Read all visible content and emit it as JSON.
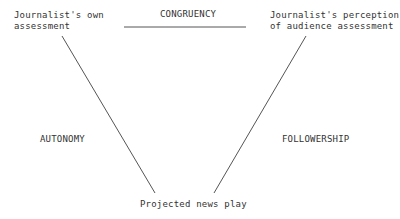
{
  "nodes": {
    "top_left": "Journalist's own\nassessment",
    "top_right": "Journalist's perception\nof audience assessment",
    "bottom": "Projected news play"
  },
  "edges": {
    "top": "CONGRUENCY",
    "left": "AUTONOMY",
    "right": "FOLLOWERSHIP"
  },
  "colors": {
    "line": "#555555",
    "text": "#333333"
  }
}
